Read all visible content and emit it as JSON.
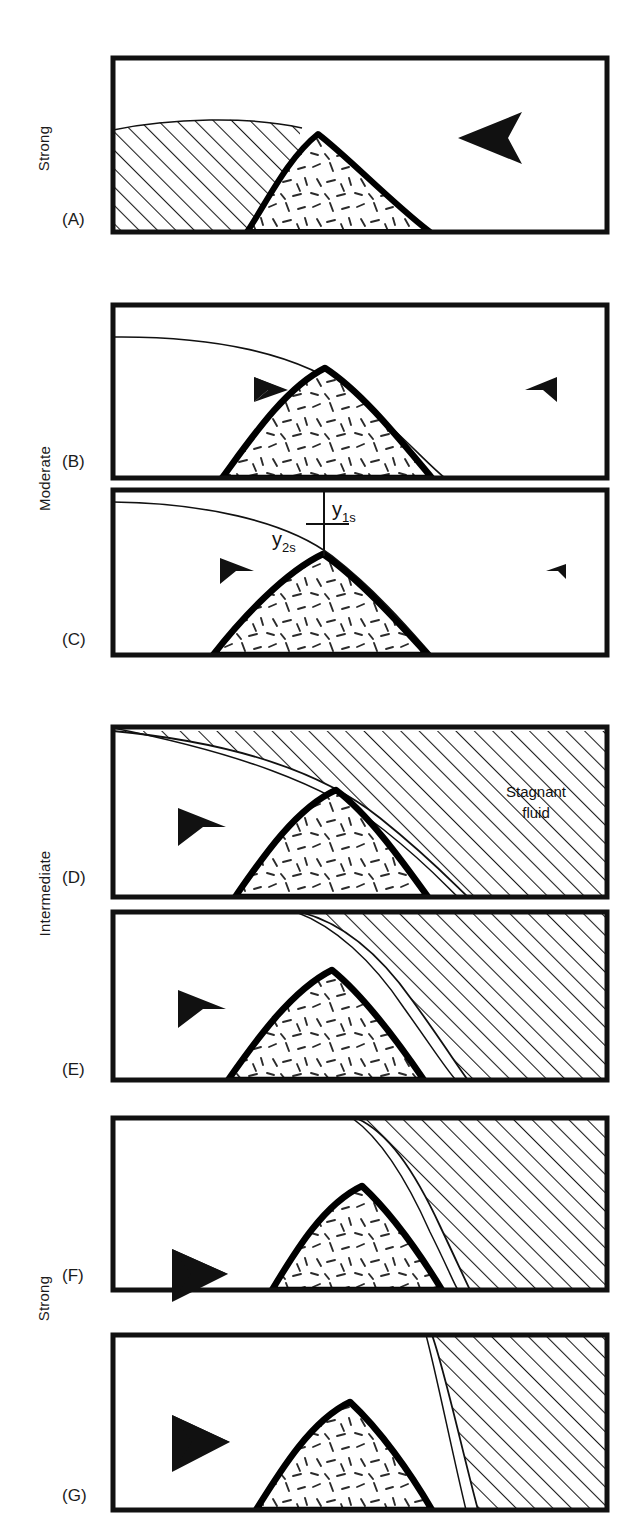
{
  "figure": {
    "type": "schematic-diagram",
    "group_labels": [
      {
        "id": "strong-top",
        "text": "Strong"
      },
      {
        "id": "moderate",
        "text": "Moderate"
      },
      {
        "id": "intermediate",
        "text": "Intermediate"
      },
      {
        "id": "strong-bottom",
        "text": "Strong"
      }
    ],
    "panels": [
      {
        "letter": "(A)",
        "group": "Strong",
        "stagnant_side": "left",
        "arrow_direction": "left",
        "arrow_size": "large",
        "has_streamline": false,
        "has_dimension_labels": false,
        "stagnant_label": ""
      },
      {
        "letter": "(B)",
        "group": "Moderate",
        "stagnant_side": "none",
        "arrow_direction": "both",
        "arrow_size": "small",
        "has_streamline": true,
        "has_dimension_labels": false,
        "stagnant_label": ""
      },
      {
        "letter": "(C)",
        "group": "Moderate",
        "stagnant_side": "none",
        "arrow_direction": "both",
        "arrow_size": "small",
        "has_streamline": true,
        "has_dimension_labels": true,
        "stagnant_label": ""
      },
      {
        "letter": "(D)",
        "group": "Intermediate",
        "stagnant_side": "right",
        "arrow_direction": "right",
        "arrow_size": "medium",
        "has_streamline": true,
        "has_dimension_labels": false,
        "stagnant_label": "Stagnant fluid"
      },
      {
        "letter": "(E)",
        "group": "Intermediate",
        "stagnant_side": "right",
        "arrow_direction": "right",
        "arrow_size": "medium",
        "has_streamline": true,
        "has_dimension_labels": false,
        "stagnant_label": ""
      },
      {
        "letter": "(F)",
        "group": "Strong",
        "stagnant_side": "right",
        "arrow_direction": "right",
        "arrow_size": "large",
        "has_streamline": true,
        "has_dimension_labels": false,
        "stagnant_label": ""
      },
      {
        "letter": "(G)",
        "group": "Strong",
        "stagnant_side": "right",
        "arrow_direction": "right",
        "arrow_size": "large",
        "has_streamline": true,
        "has_dimension_labels": false,
        "stagnant_label": ""
      }
    ],
    "annotations": {
      "stagnant_fluid_line1": "Stagnant",
      "stagnant_fluid_line2": "fluid",
      "y1s_base": "y",
      "y1s_sub": "1s",
      "y2s_base": "y",
      "y2s_sub": "2s"
    },
    "colors": {
      "ink": "#111111",
      "frame": "#111111",
      "mound_outline": "#000000",
      "hatch": "#1a1a1a",
      "background": "#ffffff"
    }
  }
}
